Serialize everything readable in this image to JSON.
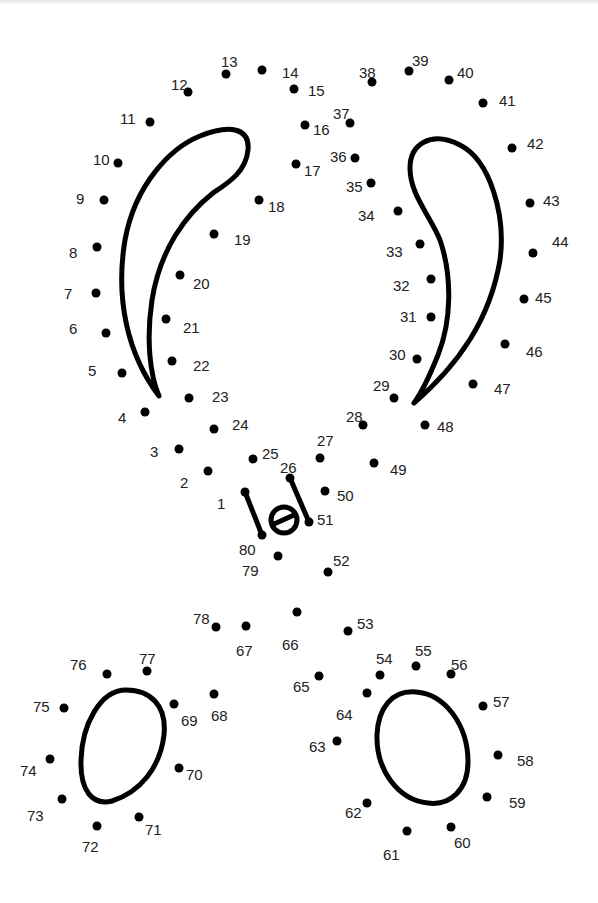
{
  "worksheet": {
    "title_fragment": "",
    "dot_color": "#000000",
    "label_color": "#222222",
    "dots": [
      {
        "n": "1",
        "x": 245,
        "y": 492,
        "lx": 217,
        "ly": 504
      },
      {
        "n": "2",
        "x": 208,
        "y": 471,
        "lx": 180,
        "ly": 483
      },
      {
        "n": "3",
        "x": 179,
        "y": 449,
        "lx": 150,
        "ly": 452
      },
      {
        "n": "4",
        "x": 145,
        "y": 412,
        "lx": 118,
        "ly": 418
      },
      {
        "n": "5",
        "x": 122,
        "y": 373,
        "lx": 88,
        "ly": 371
      },
      {
        "n": "6",
        "x": 106,
        "y": 333,
        "lx": 69,
        "ly": 329
      },
      {
        "n": "7",
        "x": 96,
        "y": 293,
        "lx": 64,
        "ly": 294
      },
      {
        "n": "8",
        "x": 97,
        "y": 247,
        "lx": 69,
        "ly": 253
      },
      {
        "n": "9",
        "x": 104,
        "y": 200,
        "lx": 76,
        "ly": 199
      },
      {
        "n": "10",
        "x": 118,
        "y": 163,
        "lx": 93,
        "ly": 160
      },
      {
        "n": "11",
        "x": 150,
        "y": 122,
        "lx": 120,
        "ly": 119
      },
      {
        "n": "12",
        "x": 188,
        "y": 92,
        "lx": 171,
        "ly": 85
      },
      {
        "n": "13",
        "x": 226,
        "y": 74,
        "lx": 221,
        "ly": 62
      },
      {
        "n": "14",
        "x": 262,
        "y": 70,
        "lx": 282,
        "ly": 73
      },
      {
        "n": "15",
        "x": 294,
        "y": 89,
        "lx": 308,
        "ly": 91
      },
      {
        "n": "16",
        "x": 305,
        "y": 125,
        "lx": 313,
        "ly": 130
      },
      {
        "n": "17",
        "x": 296,
        "y": 164,
        "lx": 304,
        "ly": 171
      },
      {
        "n": "18",
        "x": 259,
        "y": 200,
        "lx": 268,
        "ly": 207
      },
      {
        "n": "19",
        "x": 214,
        "y": 234,
        "lx": 234,
        "ly": 240
      },
      {
        "n": "20",
        "x": 180,
        "y": 275,
        "lx": 193,
        "ly": 284
      },
      {
        "n": "21",
        "x": 166,
        "y": 319,
        "lx": 183,
        "ly": 328
      },
      {
        "n": "22",
        "x": 172,
        "y": 361,
        "lx": 193,
        "ly": 366
      },
      {
        "n": "23",
        "x": 189,
        "y": 398,
        "lx": 212,
        "ly": 397
      },
      {
        "n": "24",
        "x": 214,
        "y": 429,
        "lx": 232,
        "ly": 425
      },
      {
        "n": "25",
        "x": 253,
        "y": 459,
        "lx": 262,
        "ly": 454
      },
      {
        "n": "26",
        "x": 290,
        "y": 478,
        "lx": 280,
        "ly": 468
      },
      {
        "n": "27",
        "x": 320,
        "y": 458,
        "lx": 317,
        "ly": 441
      },
      {
        "n": "28",
        "x": 363,
        "y": 425,
        "lx": 346,
        "ly": 417
      },
      {
        "n": "29",
        "x": 394,
        "y": 398,
        "lx": 373,
        "ly": 386
      },
      {
        "n": "30",
        "x": 417,
        "y": 359,
        "lx": 389,
        "ly": 355
      },
      {
        "n": "31",
        "x": 431,
        "y": 317,
        "lx": 400,
        "ly": 317
      },
      {
        "n": "32",
        "x": 431,
        "y": 279,
        "lx": 393,
        "ly": 286
      },
      {
        "n": "33",
        "x": 420,
        "y": 244,
        "lx": 386,
        "ly": 252
      },
      {
        "n": "34",
        "x": 398,
        "y": 211,
        "lx": 358,
        "ly": 216
      },
      {
        "n": "35",
        "x": 371,
        "y": 183,
        "lx": 346,
        "ly": 187
      },
      {
        "n": "36",
        "x": 355,
        "y": 158,
        "lx": 330,
        "ly": 157
      },
      {
        "n": "37",
        "x": 350,
        "y": 123,
        "lx": 333,
        "ly": 114
      },
      {
        "n": "38",
        "x": 372,
        "y": 82,
        "lx": 359,
        "ly": 73
      },
      {
        "n": "39",
        "x": 409,
        "y": 71,
        "lx": 412,
        "ly": 61
      },
      {
        "n": "40",
        "x": 449,
        "y": 80,
        "lx": 457,
        "ly": 73
      },
      {
        "n": "41",
        "x": 483,
        "y": 103,
        "lx": 499,
        "ly": 101
      },
      {
        "n": "42",
        "x": 512,
        "y": 148,
        "lx": 527,
        "ly": 144
      },
      {
        "n": "43",
        "x": 530,
        "y": 203,
        "lx": 543,
        "ly": 201
      },
      {
        "n": "44",
        "x": 533,
        "y": 253,
        "lx": 552,
        "ly": 242
      },
      {
        "n": "45",
        "x": 524,
        "y": 299,
        "lx": 535,
        "ly": 298
      },
      {
        "n": "46",
        "x": 505,
        "y": 344,
        "lx": 526,
        "ly": 352
      },
      {
        "n": "47",
        "x": 473,
        "y": 384,
        "lx": 494,
        "ly": 389
      },
      {
        "n": "48",
        "x": 425,
        "y": 425,
        "lx": 437,
        "ly": 427
      },
      {
        "n": "49",
        "x": 374,
        "y": 463,
        "lx": 390,
        "ly": 470
      },
      {
        "n": "50",
        "x": 325,
        "y": 491,
        "lx": 337,
        "ly": 496
      },
      {
        "n": "51",
        "x": 309,
        "y": 522,
        "lx": 317,
        "ly": 520
      },
      {
        "n": "52",
        "x": 328,
        "y": 572,
        "lx": 333,
        "ly": 561
      },
      {
        "n": "53",
        "x": 348,
        "y": 631,
        "lx": 357,
        "ly": 624
      },
      {
        "n": "54",
        "x": 380,
        "y": 675,
        "lx": 376,
        "ly": 659
      },
      {
        "n": "55",
        "x": 416,
        "y": 666,
        "lx": 415,
        "ly": 651
      },
      {
        "n": "56",
        "x": 451,
        "y": 674,
        "lx": 451,
        "ly": 665
      },
      {
        "n": "57",
        "x": 483,
        "y": 706,
        "lx": 493,
        "ly": 702
      },
      {
        "n": "58",
        "x": 498,
        "y": 755,
        "lx": 517,
        "ly": 761
      },
      {
        "n": "59",
        "x": 487,
        "y": 797,
        "lx": 509,
        "ly": 803
      },
      {
        "n": "60",
        "x": 451,
        "y": 827,
        "lx": 454,
        "ly": 843
      },
      {
        "n": "61",
        "x": 407,
        "y": 831,
        "lx": 383,
        "ly": 855
      },
      {
        "n": "62",
        "x": 367,
        "y": 803,
        "lx": 345,
        "ly": 813
      },
      {
        "n": "63",
        "x": 337,
        "y": 741,
        "lx": 309,
        "ly": 747
      },
      {
        "n": "64",
        "x": 367,
        "y": 693,
        "lx": 336,
        "ly": 715
      },
      {
        "n": "65",
        "x": 319,
        "y": 676,
        "lx": 293,
        "ly": 687
      },
      {
        "n": "66",
        "x": 297,
        "y": 612,
        "lx": 282,
        "ly": 645
      },
      {
        "n": "67",
        "x": 246,
        "y": 626,
        "lx": 236,
        "ly": 651
      },
      {
        "n": "68",
        "x": 214,
        "y": 694,
        "lx": 211,
        "ly": 716
      },
      {
        "n": "69",
        "x": 174,
        "y": 704,
        "lx": 181,
        "ly": 721
      },
      {
        "n": "70",
        "x": 179,
        "y": 768,
        "lx": 186,
        "ly": 775
      },
      {
        "n": "71",
        "x": 139,
        "y": 817,
        "lx": 145,
        "ly": 830
      },
      {
        "n": "72",
        "x": 97,
        "y": 826,
        "lx": 82,
        "ly": 847
      },
      {
        "n": "73",
        "x": 62,
        "y": 799,
        "lx": 27,
        "ly": 816
      },
      {
        "n": "74",
        "x": 50,
        "y": 759,
        "lx": 20,
        "ly": 771
      },
      {
        "n": "75",
        "x": 64,
        "y": 708,
        "lx": 33,
        "ly": 707
      },
      {
        "n": "76",
        "x": 107,
        "y": 674,
        "lx": 70,
        "ly": 665
      },
      {
        "n": "77",
        "x": 147,
        "y": 671,
        "lx": 139,
        "ly": 659
      },
      {
        "n": "78",
        "x": 216,
        "y": 627,
        "lx": 193,
        "ly": 619
      },
      {
        "n": "79",
        "x": 278,
        "y": 556,
        "lx": 242,
        "ly": 571
      },
      {
        "n": "80",
        "x": 262,
        "y": 535,
        "lx": 239,
        "ly": 550
      }
    ]
  }
}
